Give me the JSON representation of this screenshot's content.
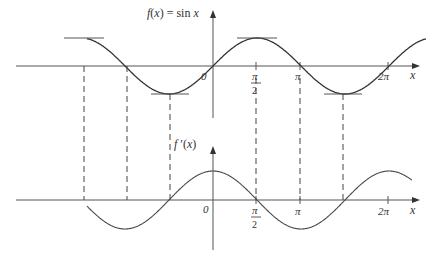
{
  "top_graph": {
    "function_label": "f(x) = sin x",
    "x_axis_label": "x",
    "ticks": [
      {
        "label": "0",
        "pos": 0
      },
      {
        "label": "π",
        "sub": "2",
        "pos": 1.5708
      },
      {
        "label": "π",
        "pos": 3.1416
      },
      {
        "label": "2π",
        "pos": 6.2832
      }
    ]
  },
  "bottom_graph": {
    "function_label": "f ′(x)",
    "x_axis_label": "x",
    "ticks": [
      {
        "label": "0",
        "pos": 0
      },
      {
        "label": "π",
        "sub": "2",
        "pos": 1.5708
      },
      {
        "label": "π",
        "pos": 3.1416
      },
      {
        "label": "2π",
        "pos": 6.2832
      }
    ]
  },
  "chart_data": {
    "type": "line",
    "series": [
      {
        "name": "f(x) = sin x",
        "function": "sin(x)",
        "x_range": [
          -4.5,
          7.6
        ]
      },
      {
        "name": "f'(x)",
        "function": "cos(x)",
        "x_range": [
          -4.5,
          7.1
        ]
      }
    ],
    "horizontal_tangents_at": [
      -4.712,
      -1.571,
      1.571,
      4.712
    ],
    "dashed_guides_at": [
      -4.712,
      -3.142,
      -1.571,
      1.571,
      3.142,
      4.712
    ]
  }
}
